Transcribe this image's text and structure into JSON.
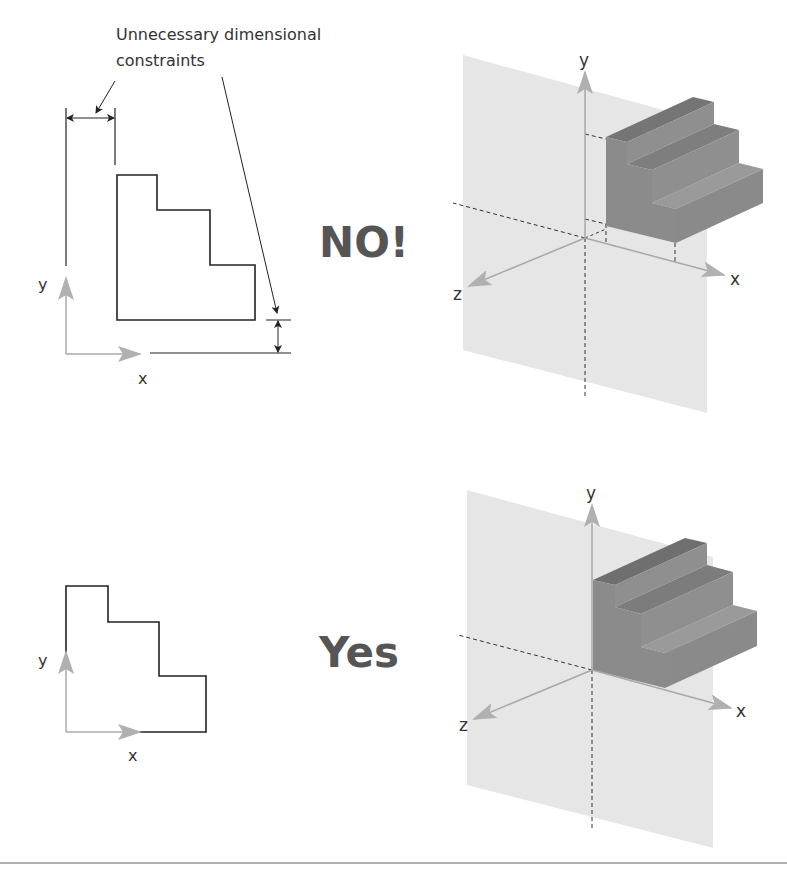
{
  "annotation": {
    "line1": "Unnecessary dimensional",
    "line2": "constraints"
  },
  "verdicts": {
    "bad": "NO!",
    "good": "Yes"
  },
  "axes": {
    "x": "x",
    "y": "y",
    "z": "z"
  },
  "colors": {
    "sketch_line": "#222222",
    "axis_gray": "#a8a8a8",
    "plane": "#e6e6e6",
    "solid_front": "#8b8b8b",
    "solid_top": "#757575",
    "solid_side": "#939393",
    "verdict_text": "#555555",
    "divider": "#b0b0b0"
  },
  "panels": [
    {
      "id": "top",
      "sketch": "staircase-profile-with-unnecessary-dimensions",
      "verdict": "NO!"
    },
    {
      "id": "bottom",
      "sketch": "staircase-profile-on-origin",
      "verdict": "Yes"
    }
  ]
}
